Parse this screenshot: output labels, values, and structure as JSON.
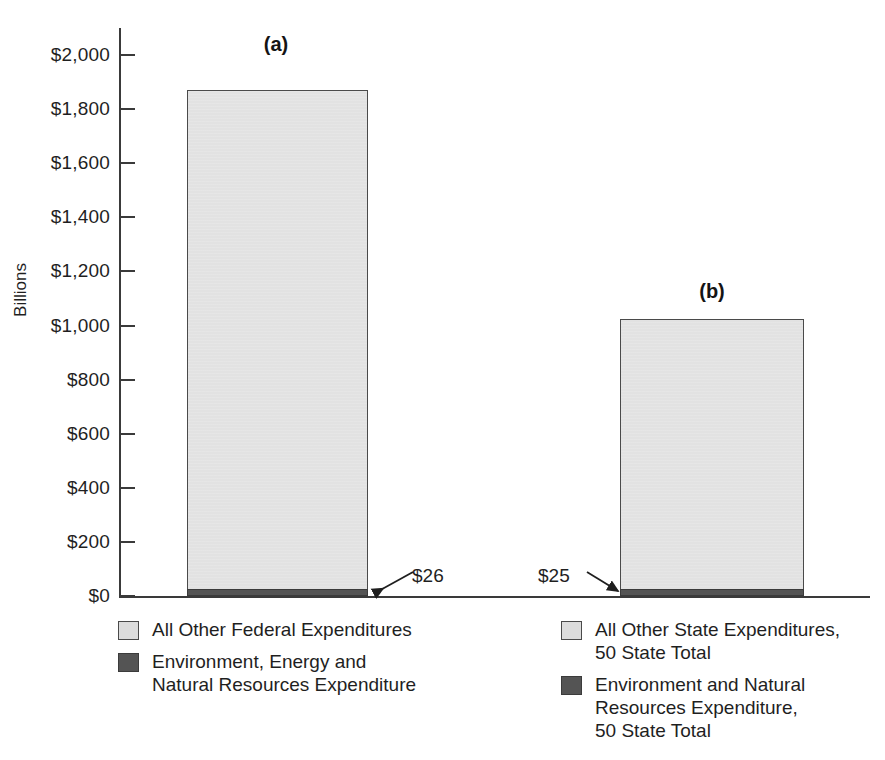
{
  "chart_data": {
    "type": "bar",
    "title": "",
    "subtitle": "",
    "xlabel": "",
    "ylabel": "Billions",
    "ylim": [
      0,
      2100
    ],
    "grid": false,
    "stacked": true,
    "legend_position": "bottom",
    "categories": [
      "(a)",
      "(b)"
    ],
    "category_labels": {
      "a": "(a)",
      "b": "(b)"
    },
    "y_ticks": [
      {
        "value": 2000,
        "label": "$2,000"
      },
      {
        "value": 1800,
        "label": "$1,800"
      },
      {
        "value": 1600,
        "label": "$1,600"
      },
      {
        "value": 1400,
        "label": "$1,400"
      },
      {
        "value": 1200,
        "label": "$1,200"
      },
      {
        "value": 1000,
        "label": "$1,000"
      },
      {
        "value": 800,
        "label": "$800"
      },
      {
        "value": 600,
        "label": "$600"
      },
      {
        "value": 400,
        "label": "$400"
      },
      {
        "value": 200,
        "label": "$200"
      },
      {
        "value": 0,
        "label": "$0"
      }
    ],
    "series": [
      {
        "name": "All Other Expenditures",
        "color": "#dcdcdc",
        "values": [
          1845,
          1000
        ]
      },
      {
        "name": "Environment and Natural Resources Expenditure",
        "color": "#545454",
        "values": [
          26,
          25
        ]
      }
    ],
    "bar_totals": [
      1871,
      1025
    ],
    "annotations": [
      {
        "text": "$26",
        "points_to": "(a) dark segment",
        "value": 26
      },
      {
        "text": "$25",
        "points_to": "(b) dark segment",
        "value": 25
      }
    ]
  },
  "axis": {
    "y_title": "Billions"
  },
  "bars": {
    "a": {
      "letter": "(a)",
      "total": 1871,
      "light_value": 1845,
      "dark_value": 26
    },
    "b": {
      "letter": "(b)",
      "total": 1025,
      "light_value": 1000,
      "dark_value": 25
    }
  },
  "callouts": {
    "federal": "$26",
    "state": "$25"
  },
  "legend_left": {
    "items": [
      {
        "swatch": "light",
        "color": "#dcdcdc",
        "label": "All Other Federal Expenditures"
      },
      {
        "swatch": "dark",
        "color": "#545454",
        "label": "Environment, Energy and\nNatural Resources Expenditure"
      }
    ]
  },
  "legend_right": {
    "items": [
      {
        "swatch": "light",
        "color": "#dcdcdc",
        "label": "All Other State Expenditures,\n50 State Total"
      },
      {
        "swatch": "dark",
        "color": "#545454",
        "label": "Environment and Natural\nResources Expenditure,\n50 State Total"
      }
    ]
  }
}
